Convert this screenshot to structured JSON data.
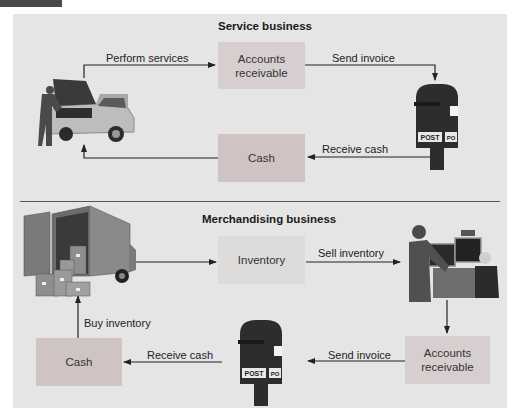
{
  "header": {
    "tab_color": "#4a4a4a"
  },
  "colors": {
    "panel_bg": "#e5e5e5",
    "accounts_receivable_box": "#d7cfcf",
    "cash_box": "#cfc3c3",
    "inventory_box": "#dedbdb",
    "arrow": "#222222"
  },
  "service": {
    "title": "Service business",
    "boxes": {
      "accounts_receivable": "Accounts receivable",
      "cash": "Cash"
    },
    "arrows": {
      "perform_services": "Perform services",
      "send_invoice": "Send invoice",
      "receive_cash": "Receive cash"
    },
    "images": [
      "mechanic-car-icon",
      "mailbox-icon"
    ]
  },
  "merchandising": {
    "title": "Merchandising business",
    "boxes": {
      "inventory": "Inventory",
      "accounts_receivable": "Accounts receivable",
      "cash": "Cash"
    },
    "arrows": {
      "sell_inventory": "Sell inventory",
      "send_invoice": "Send invoice",
      "receive_cash": "Receive cash",
      "buy_inventory": "Buy inventory"
    },
    "images": [
      "delivery-truck-icon",
      "computer-sale-icon",
      "mailbox-icon"
    ]
  }
}
